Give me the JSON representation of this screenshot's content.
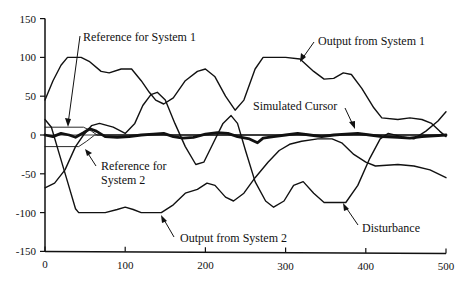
{
  "chart_data": {
    "type": "line",
    "title": "",
    "xlabel": "",
    "ylabel": "",
    "xlim": [
      0,
      500
    ],
    "ylim": [
      -150,
      150
    ],
    "x_ticks": [
      0,
      100,
      200,
      300,
      400,
      500
    ],
    "y_ticks": [
      150,
      100,
      50,
      0,
      -50,
      -100,
      -150
    ],
    "grid": false,
    "legend": "none (inline annotations with arrows)",
    "series": [
      {
        "name": "Output from System 1",
        "stroke_width": 1.4,
        "points": [
          [
            0,
            45
          ],
          [
            10,
            70
          ],
          [
            20,
            90
          ],
          [
            28,
            100
          ],
          [
            45,
            100
          ],
          [
            55,
            95
          ],
          [
            70,
            82
          ],
          [
            80,
            80
          ],
          [
            95,
            85
          ],
          [
            108,
            85
          ],
          [
            120,
            70
          ],
          [
            130,
            55
          ],
          [
            138,
            45
          ],
          [
            148,
            40
          ],
          [
            160,
            48
          ],
          [
            175,
            70
          ],
          [
            190,
            82
          ],
          [
            200,
            85
          ],
          [
            212,
            75
          ],
          [
            225,
            50
          ],
          [
            237,
            32
          ],
          [
            248,
            45
          ],
          [
            262,
            85
          ],
          [
            272,
            100
          ],
          [
            300,
            100
          ],
          [
            318,
            98
          ],
          [
            335,
            82
          ],
          [
            348,
            72
          ],
          [
            360,
            73
          ],
          [
            372,
            80
          ],
          [
            382,
            78
          ],
          [
            395,
            60
          ],
          [
            410,
            35
          ],
          [
            420,
            22
          ],
          [
            440,
            20
          ],
          [
            455,
            22
          ],
          [
            470,
            20
          ],
          [
            482,
            15
          ],
          [
            492,
            5
          ],
          [
            500,
            -2
          ]
        ]
      },
      {
        "name": "Output from System 2",
        "stroke_width": 1.4,
        "points": [
          [
            0,
            20
          ],
          [
            8,
            10
          ],
          [
            18,
            -25
          ],
          [
            28,
            -60
          ],
          [
            38,
            -95
          ],
          [
            42,
            -100
          ],
          [
            75,
            -100
          ],
          [
            90,
            -96
          ],
          [
            100,
            -93
          ],
          [
            110,
            -96
          ],
          [
            120,
            -100
          ],
          [
            145,
            -100
          ],
          [
            160,
            -90
          ],
          [
            175,
            -75
          ],
          [
            190,
            -70
          ],
          [
            202,
            -62
          ],
          [
            212,
            -65
          ],
          [
            225,
            -80
          ],
          [
            235,
            -85
          ],
          [
            248,
            -75
          ],
          [
            262,
            -55
          ],
          [
            278,
            -35
          ],
          [
            292,
            -20
          ],
          [
            305,
            -12
          ],
          [
            320,
            -8
          ],
          [
            340,
            -5
          ],
          [
            358,
            -5
          ],
          [
            370,
            -10
          ],
          [
            385,
            -25
          ],
          [
            400,
            -35
          ],
          [
            412,
            -40
          ],
          [
            440,
            -38
          ],
          [
            460,
            -40
          ],
          [
            480,
            -45
          ],
          [
            500,
            -55
          ]
        ]
      },
      {
        "name": "Disturbance",
        "stroke_width": 1.4,
        "points": [
          [
            0,
            -68
          ],
          [
            12,
            -62
          ],
          [
            25,
            -45
          ],
          [
            38,
            -15
          ],
          [
            48,
            0
          ],
          [
            58,
            12
          ],
          [
            68,
            15
          ],
          [
            85,
            10
          ],
          [
            100,
            2
          ],
          [
            112,
            15
          ],
          [
            122,
            38
          ],
          [
            132,
            52
          ],
          [
            140,
            55
          ],
          [
            150,
            45
          ],
          [
            162,
            15
          ],
          [
            175,
            -15
          ],
          [
            188,
            -38
          ],
          [
            198,
            -35
          ],
          [
            210,
            -10
          ],
          [
            222,
            15
          ],
          [
            232,
            25
          ],
          [
            240,
            15
          ],
          [
            250,
            -20
          ],
          [
            262,
            -60
          ],
          [
            275,
            -85
          ],
          [
            285,
            -93
          ],
          [
            298,
            -85
          ],
          [
            310,
            -65
          ],
          [
            322,
            -60
          ],
          [
            335,
            -75
          ],
          [
            348,
            -87
          ],
          [
            375,
            -87
          ],
          [
            390,
            -65
          ],
          [
            405,
            -30
          ],
          [
            418,
            -5
          ],
          [
            428,
            2
          ],
          [
            445,
            -2
          ],
          [
            460,
            -5
          ],
          [
            475,
            5
          ],
          [
            490,
            18
          ],
          [
            500,
            30
          ]
        ]
      },
      {
        "name": "Reference for System 1",
        "stroke_width": 0.9,
        "points": [
          [
            0,
            10
          ],
          [
            48,
            10
          ],
          [
            58,
            5
          ],
          [
            65,
            0
          ],
          [
            500,
            0
          ]
        ]
      },
      {
        "name": "Reference for System 2",
        "stroke_width": 0.9,
        "points": [
          [
            0,
            -15
          ],
          [
            42,
            -15
          ],
          [
            52,
            -8
          ],
          [
            62,
            0
          ],
          [
            500,
            0
          ]
        ]
      },
      {
        "name": "Simulated Cursor",
        "stroke_width": 2.8,
        "points": [
          [
            0,
            0
          ],
          [
            10,
            -2
          ],
          [
            20,
            2
          ],
          [
            30,
            0
          ],
          [
            38,
            -3
          ],
          [
            48,
            3
          ],
          [
            56,
            8
          ],
          [
            64,
            5
          ],
          [
            75,
            -2
          ],
          [
            90,
            -3
          ],
          [
            105,
            -2
          ],
          [
            120,
            0
          ],
          [
            135,
            1
          ],
          [
            148,
            2
          ],
          [
            160,
            -2
          ],
          [
            172,
            -4
          ],
          [
            185,
            -3
          ],
          [
            200,
            1
          ],
          [
            215,
            3
          ],
          [
            228,
            2
          ],
          [
            240,
            -2
          ],
          [
            255,
            -5
          ],
          [
            265,
            -10
          ],
          [
            272,
            -4
          ],
          [
            285,
            -2
          ],
          [
            300,
            0
          ],
          [
            315,
            2
          ],
          [
            330,
            0
          ],
          [
            345,
            -2
          ],
          [
            360,
            0
          ],
          [
            375,
            1
          ],
          [
            390,
            2
          ],
          [
            405,
            0
          ],
          [
            420,
            -2
          ],
          [
            440,
            -3
          ],
          [
            455,
            -4
          ],
          [
            470,
            -2
          ],
          [
            485,
            -1
          ],
          [
            500,
            0
          ]
        ]
      }
    ],
    "annotations": [
      {
        "text": "Reference for System 1",
        "points_to_x": 28,
        "points_to_y": 10
      },
      {
        "text": "Output from System 1",
        "points_to_x": 318,
        "points_to_y": 96
      },
      {
        "text": "Simulated Cursor",
        "points_to_x": 422,
        "points_to_y": 2
      },
      {
        "text": "Reference for System 2",
        "points_to_x": 52,
        "points_to_y": -12
      },
      {
        "text": "Output from System 2",
        "points_to_x": 150,
        "points_to_y": -100
      },
      {
        "text": "Disturbance",
        "points_to_x": 365,
        "points_to_y": -88
      }
    ]
  },
  "labels": {
    "ref1": "Reference for System 1",
    "out1": "Output from System 1",
    "cursor": "Simulated Cursor",
    "ref2_line1": "Reference for",
    "ref2_line2": "System 2",
    "out2": "Output from System 2",
    "disturbance": "Disturbance"
  }
}
